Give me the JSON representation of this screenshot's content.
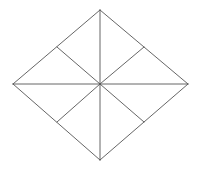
{
  "diagram": {
    "type": "rhombus-subdivided",
    "background": "#ffffff",
    "stroke_color": "#555555",
    "stroke_width": 0.9,
    "vertices": {
      "top": [
        100,
        10
      ],
      "right": [
        188,
        84
      ],
      "bottom": [
        100,
        160
      ],
      "left": [
        13,
        84
      ]
    },
    "center": [
      100,
      84
    ],
    "side_midpoints": {
      "upper_left": [
        57,
        47
      ],
      "upper_right": [
        144,
        47
      ],
      "lower_right": [
        144,
        122
      ],
      "lower_left": [
        57,
        122
      ]
    },
    "segments": [
      {
        "name": "side-top-right",
        "from": [
          100,
          10
        ],
        "to": [
          188,
          84
        ]
      },
      {
        "name": "side-right-bottom",
        "from": [
          188,
          84
        ],
        "to": [
          100,
          160
        ]
      },
      {
        "name": "side-bottom-left",
        "from": [
          100,
          160
        ],
        "to": [
          13,
          84
        ]
      },
      {
        "name": "side-left-top",
        "from": [
          13,
          84
        ],
        "to": [
          100,
          10
        ]
      },
      {
        "name": "vertical-diagonal",
        "from": [
          100,
          10
        ],
        "to": [
          100,
          160
        ]
      },
      {
        "name": "horizontal-diagonal",
        "from": [
          13,
          84
        ],
        "to": [
          188,
          84
        ]
      },
      {
        "name": "center-to-upper-left-midpoint",
        "from": [
          100,
          84
        ],
        "to": [
          57,
          47
        ]
      },
      {
        "name": "center-to-upper-right-midpoint",
        "from": [
          100,
          84
        ],
        "to": [
          144,
          47
        ]
      },
      {
        "name": "center-to-lower-right-midpoint",
        "from": [
          100,
          84
        ],
        "to": [
          144,
          122
        ]
      },
      {
        "name": "center-to-lower-left-midpoint",
        "from": [
          100,
          84
        ],
        "to": [
          57,
          122
        ]
      }
    ]
  }
}
